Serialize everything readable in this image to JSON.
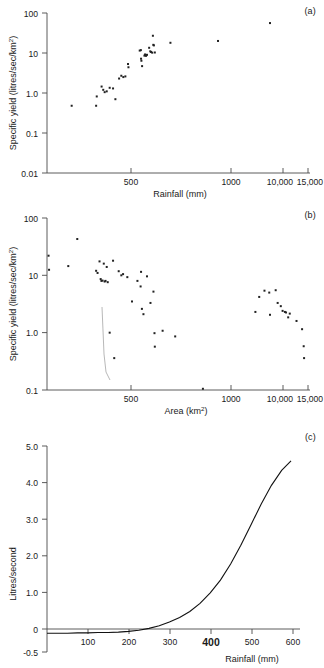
{
  "figure": {
    "panels": [
      {
        "tag": "(a)",
        "ylabel_text": "Specific yield (litres/sec/km",
        "ylabel_sup": "2",
        "ylabel_tail": ")",
        "xlabel": "Rainfall (mm)",
        "ytick_labels": [
          "100",
          "10",
          "1.0",
          "0.1",
          "0.01"
        ],
        "xtick_labels": [
          "500",
          "1000",
          "10,000",
          "15,000"
        ]
      },
      {
        "tag": "(b)",
        "ylabel_text": "Specific yield (litres/sec/km",
        "ylabel_sup": "2",
        "ylabel_tail": ")",
        "xlabel_text": "Area (km",
        "xlabel_sup": "2",
        "xlabel_tail": ")",
        "ytick_labels": [
          "100",
          "10",
          "1.0",
          "0.1"
        ],
        "xtick_labels": [
          "500",
          "1000",
          "10,000",
          "15,000"
        ]
      },
      {
        "tag": "(c)",
        "ylabel": "Litres/second",
        "xlabel": "Rainfall (mm)",
        "ytick_labels": [
          "5.0",
          "4.0",
          "3.0",
          "2.0",
          "1.0",
          "0",
          "-0.5"
        ],
        "xtick_labels": [
          "100",
          "200",
          "300",
          "400",
          "500",
          "600"
        ],
        "xtick_emphasis": "400"
      }
    ]
  },
  "chart_data": [
    {
      "type": "scatter",
      "title": "(a)",
      "xlabel": "Rainfall (mm)",
      "ylabel": "Specific yield (litres/sec/km2)",
      "xscale": "log",
      "yscale": "log",
      "xlim": [
        100,
        15000
      ],
      "ylim": [
        0.01,
        100
      ],
      "xticks": [
        500,
        1000,
        10000,
        15000
      ],
      "yticks": [
        0.01,
        0.1,
        1.0,
        10,
        100
      ],
      "grid": false,
      "legend": "none",
      "points": [
        {
          "x": 160,
          "y": 0.48
        },
        {
          "x": 255,
          "y": 0.48
        },
        {
          "x": 258,
          "y": 0.82
        },
        {
          "x": 283,
          "y": 1.45
        },
        {
          "x": 292,
          "y": 1.2
        },
        {
          "x": 300,
          "y": 1.05
        },
        {
          "x": 312,
          "y": 1.1
        },
        {
          "x": 330,
          "y": 1.35
        },
        {
          "x": 352,
          "y": 1.3
        },
        {
          "x": 368,
          "y": 0.7
        },
        {
          "x": 395,
          "y": 2.3
        },
        {
          "x": 412,
          "y": 2.7
        },
        {
          "x": 428,
          "y": 2.5
        },
        {
          "x": 445,
          "y": 2.6
        },
        {
          "x": 468,
          "y": 5.3
        },
        {
          "x": 472,
          "y": 4.4
        },
        {
          "x": 585,
          "y": 11.5
        },
        {
          "x": 598,
          "y": 11.8
        },
        {
          "x": 600,
          "y": 7.2
        },
        {
          "x": 604,
          "y": 6.4
        },
        {
          "x": 612,
          "y": 4.7
        },
        {
          "x": 640,
          "y": 8.6
        },
        {
          "x": 648,
          "y": 9.2
        },
        {
          "x": 652,
          "y": 8.8
        },
        {
          "x": 660,
          "y": 8.5
        },
        {
          "x": 672,
          "y": 9.0
        },
        {
          "x": 700,
          "y": 13.5
        },
        {
          "x": 715,
          "y": 11.0
        },
        {
          "x": 726,
          "y": 10.6
        },
        {
          "x": 742,
          "y": 10.2
        },
        {
          "x": 752,
          "y": 27.0
        },
        {
          "x": 758,
          "y": 16.0
        },
        {
          "x": 766,
          "y": 15.5
        },
        {
          "x": 780,
          "y": 10.3
        },
        {
          "x": 1050,
          "y": 18.0
        },
        {
          "x": 2600,
          "y": 20.0
        },
        {
          "x": 7000,
          "y": 56.0
        }
      ]
    },
    {
      "type": "scatter",
      "title": "(b)",
      "xlabel": "Area (km2)",
      "ylabel": "Specific yield (litres/sec/km2)",
      "xscale": "log",
      "yscale": "log",
      "xlim": [
        100,
        15000
      ],
      "ylim": [
        0.1,
        100
      ],
      "xticks": [
        500,
        1000,
        10000,
        15000
      ],
      "yticks": [
        0.1,
        1.0,
        10,
        100
      ],
      "grid": false,
      "legend": "none",
      "points": [
        {
          "x": 103,
          "y": 22.0
        },
        {
          "x": 104,
          "y": 12.5
        },
        {
          "x": 150,
          "y": 14.5
        },
        {
          "x": 178,
          "y": 43.0
        },
        {
          "x": 255,
          "y": 12.0
        },
        {
          "x": 262,
          "y": 11.0
        },
        {
          "x": 272,
          "y": 17.5
        },
        {
          "x": 278,
          "y": 8.6
        },
        {
          "x": 282,
          "y": 8.0
        },
        {
          "x": 288,
          "y": 8.1
        },
        {
          "x": 295,
          "y": 16.0
        },
        {
          "x": 300,
          "y": 7.8
        },
        {
          "x": 305,
          "y": 8.0
        },
        {
          "x": 312,
          "y": 14.0
        },
        {
          "x": 318,
          "y": 7.6
        },
        {
          "x": 352,
          "y": 18.0
        },
        {
          "x": 330,
          "y": 1.0
        },
        {
          "x": 360,
          "y": 0.36
        },
        {
          "x": 392,
          "y": 11.8
        },
        {
          "x": 412,
          "y": 10.0
        },
        {
          "x": 426,
          "y": 10.5
        },
        {
          "x": 462,
          "y": 9.3
        },
        {
          "x": 505,
          "y": 3.5
        },
        {
          "x": 560,
          "y": 8.0
        },
        {
          "x": 600,
          "y": 11.5
        },
        {
          "x": 595,
          "y": 6.4
        },
        {
          "x": 610,
          "y": 2.6
        },
        {
          "x": 628,
          "y": 2.1
        },
        {
          "x": 672,
          "y": 9.6
        },
        {
          "x": 718,
          "y": 3.3
        },
        {
          "x": 760,
          "y": 5.2
        },
        {
          "x": 775,
          "y": 0.98
        },
        {
          "x": 780,
          "y": 0.57
        },
        {
          "x": 905,
          "y": 1.08
        },
        {
          "x": 1150,
          "y": 0.86
        },
        {
          "x": 1950,
          "y": 0.105
        },
        {
          "x": 5300,
          "y": 2.3
        },
        {
          "x": 5700,
          "y": 4.2
        },
        {
          "x": 6300,
          "y": 5.4
        },
        {
          "x": 6900,
          "y": 5.0
        },
        {
          "x": 7000,
          "y": 2.05
        },
        {
          "x": 7800,
          "y": 5.5
        },
        {
          "x": 8100,
          "y": 3.3
        },
        {
          "x": 8600,
          "y": 2.9
        },
        {
          "x": 8900,
          "y": 2.4
        },
        {
          "x": 9300,
          "y": 2.3
        },
        {
          "x": 9500,
          "y": 2.25
        },
        {
          "x": 9900,
          "y": 1.85
        },
        {
          "x": 10200,
          "y": 2.15
        },
        {
          "x": 11600,
          "y": 1.6
        },
        {
          "x": 12900,
          "y": 1.15
        },
        {
          "x": 13300,
          "y": 0.58
        },
        {
          "x": 13400,
          "y": 0.36
        }
      ]
    },
    {
      "type": "line",
      "title": "(c)",
      "xlabel": "Rainfall (mm)",
      "ylabel": "Litres/second",
      "xscale": "linear",
      "yscale": "linear",
      "xlim": [
        0,
        620
      ],
      "ylim": [
        -0.5,
        5.0
      ],
      "xticks": [
        100,
        200,
        300,
        400,
        500,
        600
      ],
      "yticks": [
        -0.5,
        0,
        1.0,
        2.0,
        3.0,
        4.0,
        5.0
      ],
      "grid": false,
      "legend": "none",
      "series": [
        {
          "name": "fitted exponential",
          "x": [
            0,
            25,
            50,
            75,
            100,
            125,
            150,
            175,
            200,
            225,
            250,
            275,
            300,
            325,
            350,
            375,
            400,
            425,
            450,
            475,
            500,
            525,
            550,
            575,
            598
          ],
          "y": [
            0.0,
            0.0,
            0.0,
            0.01,
            0.01,
            0.02,
            0.02,
            0.03,
            0.05,
            0.08,
            0.13,
            0.2,
            0.3,
            0.42,
            0.58,
            0.8,
            1.08,
            1.42,
            1.85,
            2.35,
            2.9,
            3.45,
            3.95,
            4.35,
            4.6
          ]
        }
      ]
    }
  ]
}
